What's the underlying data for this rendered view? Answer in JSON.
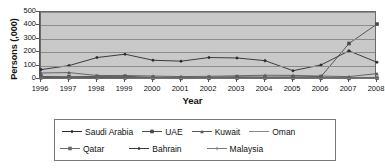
{
  "chart_data": {
    "type": "line",
    "title": "",
    "xlabel": "Year",
    "ylabel": "Persons (,000)",
    "x": [
      1996,
      1997,
      1998,
      1999,
      2000,
      2001,
      2002,
      2003,
      2004,
      2005,
      2006,
      2007,
      2008
    ],
    "xticklabels": [
      "1996",
      "1997",
      "1998",
      "1999",
      "2000",
      "2001",
      "2002",
      "2003",
      "2004",
      "2005",
      "2006",
      "2007",
      "2008"
    ],
    "yticklabels": [
      "0",
      "100",
      "200",
      "300",
      "400",
      "500"
    ],
    "yticks": [
      0,
      100,
      200,
      300,
      400,
      500
    ],
    "ylim": [
      0,
      500
    ],
    "grid": "horizontal",
    "legend_position": "bottom",
    "plot_background": "#c9c9c9",
    "series": [
      {
        "name": "Saudi Arabia",
        "marker": "diamond",
        "color": "#2b2b2b",
        "values": [
          70,
          100,
          160,
          185,
          140,
          133,
          160,
          157,
          137,
          62,
          105,
          210,
          125
        ]
      },
      {
        "name": "UAE",
        "marker": "square",
        "color": "#4a4a4a",
        "values": [
          19,
          17,
          19,
          20,
          12,
          10,
          12,
          16,
          14,
          15,
          18,
          265,
          410
        ]
      },
      {
        "name": "Kuwait",
        "marker": "triangle",
        "color": "#5a5a5a",
        "values": [
          45,
          48,
          26,
          26,
          22,
          18,
          20,
          24,
          28,
          27,
          22,
          18,
          40
        ]
      },
      {
        "name": "Oman",
        "marker": "none",
        "color": "#8a8a8a",
        "values": [
          12,
          10,
          12,
          10,
          8,
          7,
          8,
          9,
          9,
          8,
          7,
          6,
          8
        ]
      },
      {
        "name": "Qatar",
        "marker": "square",
        "color": "#6a6a6a",
        "values": [
          10,
          9,
          10,
          9,
          6,
          5,
          6,
          7,
          7,
          6,
          6,
          5,
          7
        ]
      },
      {
        "name": "Bahrain",
        "marker": "diamond",
        "color": "#3a3a3a",
        "values": [
          8,
          7,
          8,
          7,
          5,
          4,
          5,
          6,
          6,
          5,
          5,
          4,
          6
        ]
      },
      {
        "name": "Malaysia",
        "marker": "plus",
        "color": "#7a7a7a",
        "values": [
          6,
          5,
          6,
          5,
          4,
          3,
          4,
          4,
          5,
          4,
          4,
          3,
          5
        ]
      }
    ]
  },
  "legend": {
    "rows": [
      [
        {
          "label": "Saudi Arabia",
          "marker": "diamond"
        },
        {
          "label": "UAE",
          "marker": "square"
        },
        {
          "label": "Kuwait",
          "marker": "triangle"
        },
        {
          "label": "Oman",
          "marker": "none"
        }
      ],
      [
        {
          "label": "Qatar",
          "marker": "square"
        },
        {
          "label": "Bahrain",
          "marker": "diamond"
        },
        {
          "label": "Malaysia",
          "marker": "plus"
        }
      ]
    ]
  }
}
